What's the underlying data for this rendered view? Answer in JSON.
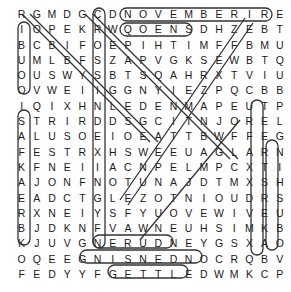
{
  "puzzle": {
    "type": "word-search",
    "size": [
      18,
      18
    ],
    "rows": [
      "RGMDGCDNOVEMBERIRE",
      "IOPEKRWQOENSDHZEBT",
      "BCBIFOEPIHTIMFFBMU",
      "UMLBFSZAPVGKSEWBTQ",
      "OUSWYSBTSQAHRXTVIU",
      "OVWEIIGGNYIEZPQCBB",
      "IQIXHNLEDENMAPEUTP",
      "STRIRDDSGCITNJOREL",
      "ALUSOEIOEATTBWFFEG",
      "FESTRXHSWEEUAGLARN",
      "KFNEIIACNPELMPCXTI",
      "AJONFNOTUNAJDTMXSH",
      "EADCTGLEZOTNIOUDRS",
      "RXNEIYSFYUOVEWIVEU",
      "BJDKNFVAWNEUHSIMKB",
      "KJUVGNERUDNEYGSXAO",
      "OQEEGNISNEDNOCRQBV",
      "FEDYYFGETTLEDWMKCP"
    ],
    "found_words": [
      "NOVEMBER",
      "OENS",
      "SETTLED",
      "GNISNEDNOC",
      "ERUDNE"
    ]
  },
  "colors": {
    "letter": "#1a1a1a",
    "highlight_stroke": "#333333"
  }
}
